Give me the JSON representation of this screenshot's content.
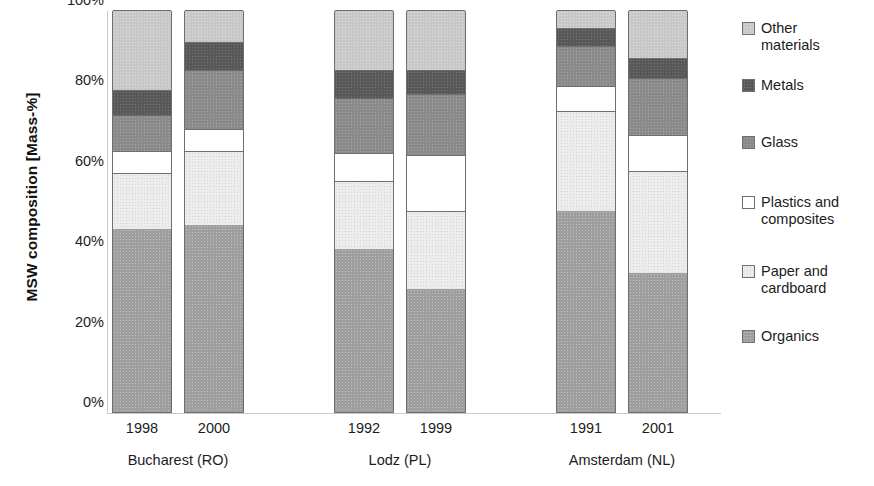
{
  "chart_data": {
    "type": "bar",
    "subtype": "stacked-bar-100-percent",
    "title": "",
    "xlabel": "",
    "ylabel": "MSW composition [Mass-%]",
    "ylim": [
      0,
      100
    ],
    "yticks": [
      "0%",
      "20%",
      "40%",
      "60%",
      "80%",
      "100%"
    ],
    "ytick_values": [
      0,
      20,
      40,
      60,
      80,
      100
    ],
    "grid": false,
    "legend_position": "right",
    "stack_order_bottom_to_top": [
      "Organics",
      "Paper and cardboard",
      "Plastics and composites",
      "Glass",
      "Metals",
      "Other materials"
    ],
    "categories": [
      "1998",
      "2000",
      "1992",
      "1999",
      "1991",
      "2001"
    ],
    "groups": [
      {
        "name": "Bucharest (RO)",
        "categories": [
          "1998",
          "2000"
        ]
      },
      {
        "name": "Lodz (PL)",
        "categories": [
          "1992",
          "1999"
        ]
      },
      {
        "name": "Amsterdam (NL)",
        "categories": [
          "1991",
          "2001"
        ]
      }
    ],
    "series": [
      {
        "name": "Organics",
        "color": "#9e9e9e",
        "values": [
          45.5,
          46.5,
          40.5,
          30.5,
          50.0,
          34.5
        ]
      },
      {
        "name": "Paper and cardboard",
        "color": "#ededed",
        "values": [
          14.0,
          18.5,
          17.0,
          19.5,
          25.0,
          25.5
        ]
      },
      {
        "name": "Plastics and composites",
        "color": "#ffffff",
        "values": [
          5.5,
          5.5,
          7.0,
          14.0,
          6.0,
          9.0
        ]
      },
      {
        "name": "Glass",
        "color": "#8a8a8a",
        "values": [
          9.0,
          14.5,
          13.5,
          15.0,
          10.0,
          14.0
        ]
      },
      {
        "name": "Metals",
        "color": "#585858",
        "values": [
          6.0,
          7.0,
          7.0,
          6.0,
          4.5,
          5.0
        ]
      },
      {
        "name": "Other materials",
        "color": "#c8c8c8",
        "values": [
          20.0,
          8.0,
          15.0,
          15.0,
          4.5,
          12.0
        ]
      }
    ],
    "cumulative_tops": [
      [
        45.5,
        59.5,
        65.0,
        74.0,
        80.0,
        100.0
      ],
      [
        46.5,
        65.0,
        70.5,
        85.0,
        92.0,
        100.0
      ],
      [
        40.5,
        57.5,
        64.5,
        78.0,
        85.0,
        100.0
      ],
      [
        30.5,
        50.0,
        64.0,
        79.0,
        85.0,
        100.0
      ],
      [
        50.0,
        75.0,
        81.0,
        91.0,
        95.5,
        100.0
      ],
      [
        34.5,
        60.0,
        69.0,
        83.0,
        88.0,
        100.0
      ]
    ]
  },
  "legend": {
    "items": [
      {
        "label": "Other\nmaterials",
        "color": "#c8c8c8",
        "fill_class": "fill-other",
        "top": 0
      },
      {
        "label": "Metals",
        "color": "#585858",
        "fill_class": "fill-metals",
        "top": 57
      },
      {
        "label": "Glass",
        "color": "#8a8a8a",
        "fill_class": "fill-glass",
        "top": 114
      },
      {
        "label": "Plastics and\ncomposites",
        "color": "#ffffff",
        "fill_class": "fill-plastics",
        "top": 174
      },
      {
        "label": "Paper and\ncardboard",
        "color": "#ededed",
        "fill_class": "fill-paper",
        "top": 243
      },
      {
        "label": "Organics",
        "color": "#9e9e9e",
        "fill_class": "fill-organics",
        "top": 308
      }
    ]
  },
  "axis": {
    "y_title": "MSW composition [Mass-%]",
    "y_tick_labels": [
      "100%",
      "80%",
      "60%",
      "40%",
      "20%",
      "0%"
    ],
    "x_tick_labels": [
      "1998",
      "2000",
      "1992",
      "1999",
      "1991",
      "2001"
    ],
    "group_labels": [
      "Bucharest (RO)",
      "Lodz (PL)",
      "Amsterdam (NL)"
    ]
  }
}
